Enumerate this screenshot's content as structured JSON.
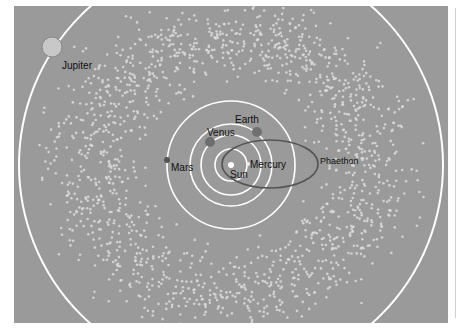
{
  "diagram": {
    "colors": {
      "background": "#9a9a9a",
      "orbit": "#ffffff",
      "asteroid": "#dcdcdc",
      "phaethon_orbit": "#555555",
      "label": "#111111"
    },
    "sun": {
      "label": "Sun",
      "x": 231,
      "y": 165
    },
    "orbits": [
      {
        "name": "Mercury",
        "r": 16
      },
      {
        "name": "Venus",
        "r": 30
      },
      {
        "name": "Earth",
        "r": 41
      },
      {
        "name": "Mars",
        "r": 64
      },
      {
        "name": "Jupiter",
        "r": 212
      }
    ],
    "bodies": [
      {
        "name": "Jupiter",
        "label": "Jupiter",
        "x": 52,
        "y": 47,
        "r": 10,
        "label_x": 62,
        "label_y": 61
      },
      {
        "name": "Mars",
        "label": "Mars",
        "x": 167,
        "y": 160,
        "r": 3,
        "label_x": 171,
        "label_y": 163
      },
      {
        "name": "Venus",
        "label": "Venus",
        "x": 210,
        "y": 142,
        "r": 5,
        "label_x": 207,
        "label_y": 128
      },
      {
        "name": "Earth",
        "label": "Earth",
        "x": 257,
        "y": 132,
        "r": 5,
        "label_x": 235,
        "label_y": 115
      },
      {
        "name": "Mercury",
        "label": "Mercury",
        "x": 248,
        "y": 164,
        "r": 2,
        "label_x": 250,
        "label_y": 160
      },
      {
        "name": "Sun",
        "label": "Sun",
        "x": 231,
        "y": 165,
        "r": 3,
        "label_x": 230,
        "label_y": 170
      }
    ],
    "phaethon": {
      "label": "Phaethon",
      "cx": 270,
      "cy": 164,
      "rx": 48,
      "ry": 24,
      "label_x": 320,
      "label_y": 157
    },
    "asteroid_belt": {
      "count": 1500,
      "inner_r": 70,
      "outer_r": 200,
      "peak_r": 120,
      "seed": 7
    }
  }
}
